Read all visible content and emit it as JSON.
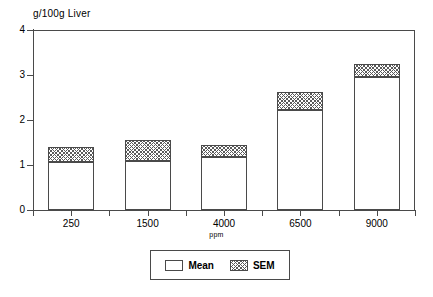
{
  "chart_data": {
    "type": "bar",
    "title": "",
    "subtitle": "",
    "ylabel": "g/100g Liver",
    "xlabel": "ppm",
    "categories": [
      "250",
      "1500",
      "4000",
      "6500",
      "9000"
    ],
    "ylim": [
      0,
      4
    ],
    "y_ticks": [
      "0",
      "1",
      "2",
      "3",
      "4"
    ],
    "grid": false,
    "stacked": true,
    "legend_position": "bottom",
    "series": [
      {
        "name": "Mean",
        "values": [
          1.07,
          1.09,
          1.18,
          2.22,
          2.95
        ]
      },
      {
        "name": "SEM",
        "values": [
          0.33,
          0.47,
          0.26,
          0.4,
          0.29
        ]
      }
    ],
    "totals": [
      1.4,
      1.56,
      1.44,
      2.62,
      3.24
    ]
  },
  "axes": {
    "y_title": "g/100g Liver",
    "x_title": "ppm",
    "y_tick_labels": [
      "4",
      "3",
      "2",
      "1",
      "0"
    ],
    "x_tick_labels": [
      "250",
      "1500",
      "4000",
      "6500",
      "9000"
    ]
  },
  "legend": {
    "items": [
      {
        "label": "Mean",
        "style": "solid-white"
      },
      {
        "label": "SEM",
        "style": "hatched"
      }
    ]
  },
  "colors": {
    "axis": "#4a4a4a",
    "bar_fill": "#ffffff",
    "hatch": "#5a5a5a",
    "background": "#ffffff"
  }
}
